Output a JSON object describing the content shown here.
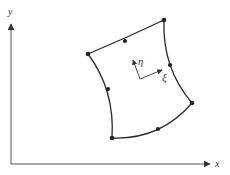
{
  "diagram": {
    "global_axes": {
      "x_label": "x",
      "y_label": "y"
    },
    "local_axes": {
      "xi_label": "ξ",
      "eta_label": "η"
    },
    "element": {
      "type": "8-node curved quadrilateral",
      "corner_node_count": 4,
      "midside_node_count": 4
    },
    "colors": {
      "line": "#2a2a2a",
      "axis": "#555555",
      "text": "#333333"
    }
  }
}
